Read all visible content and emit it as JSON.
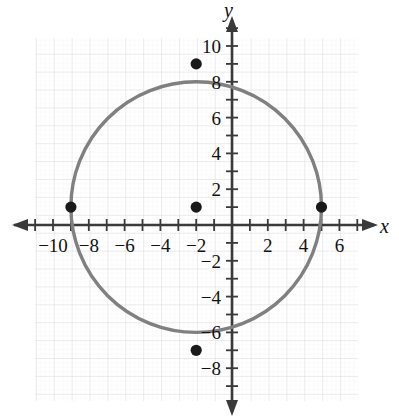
{
  "figure": {
    "title": "",
    "x_axis_label": "x",
    "y_axis_label": "y",
    "background_color": "#ffffff",
    "grid_color": "#d9d9e0",
    "minor_grid_color": "#ececf2",
    "axis_color": "#3a3a3a",
    "curve_color": "#808080",
    "point_color": "#1a1a1a"
  },
  "x_ticks": [
    {
      "label": "-10",
      "value": -10
    },
    {
      "label": "-8",
      "value": -8
    },
    {
      "label": "-6",
      "value": -6
    },
    {
      "label": "-4",
      "value": -4
    },
    {
      "label": "-2",
      "value": -2
    },
    {
      "label": "2",
      "value": 2
    },
    {
      "label": "4",
      "value": 4
    },
    {
      "label": "6",
      "value": 6
    }
  ],
  "y_ticks": [
    {
      "label": "10",
      "value": 10
    },
    {
      "label": "8",
      "value": 8
    },
    {
      "label": "6",
      "value": 6
    },
    {
      "label": "4",
      "value": 4
    },
    {
      "label": "2",
      "value": 2
    },
    {
      "label": "-2",
      "value": -2
    },
    {
      "label": "-4",
      "value": -4
    },
    {
      "label": "-6",
      "value": -6
    },
    {
      "label": "-8",
      "value": -8
    }
  ],
  "chart_data": {
    "type": "scatter",
    "title": "",
    "xlabel": "x",
    "ylabel": "y",
    "xlim": [
      -11.5,
      7.5
    ],
    "ylim": [
      -9.5,
      10.8
    ],
    "grid": true,
    "legend": "none",
    "series": [
      {
        "name": "circle",
        "type": "circle",
        "center": [
          -2,
          1
        ],
        "radius": 7,
        "equation": "(x + 2)^2 + (y - 1)^2 = 49",
        "color": "#808080"
      },
      {
        "name": "marked points",
        "type": "scatter",
        "color": "#1a1a1a",
        "points": [
          {
            "x": -2,
            "y": 1,
            "role": "center"
          },
          {
            "x": -2,
            "y": 9,
            "role": "top"
          },
          {
            "x": -2,
            "y": -7,
            "role": "bottom"
          },
          {
            "x": -9,
            "y": 1,
            "role": "left"
          },
          {
            "x": 5,
            "y": 1,
            "role": "right"
          }
        ]
      }
    ],
    "x_tick_values": [
      -10,
      -8,
      -6,
      -4,
      -2,
      2,
      4,
      6
    ],
    "y_tick_values": [
      10,
      8,
      6,
      4,
      2,
      -2,
      -4,
      -6,
      -8
    ],
    "x_minor_tick_step": 1,
    "y_minor_tick_step": 1
  }
}
